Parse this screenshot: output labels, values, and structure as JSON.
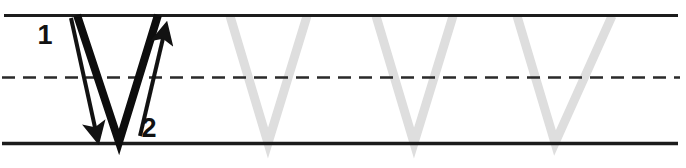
{
  "worksheet": {
    "title": "Letter V handwriting practice worksheet",
    "letter": "V",
    "case": "uppercase",
    "width": 686,
    "height": 168,
    "background_color": "#ffffff"
  },
  "guide_lines": {
    "top_line": {
      "label": "top-line",
      "style": "solid",
      "y": 15.5,
      "x_start": 4,
      "x_end": 678,
      "color": "#1c1c1c",
      "thickness": 3
    },
    "mid_line": {
      "label": "mid-dashed-line",
      "style": "dashed",
      "y": 77.5,
      "x_start": 2,
      "x_end": 680,
      "color": "#2a2a2a",
      "thickness": 2.4,
      "dash": 13,
      "gap": 8
    },
    "bottom_line": {
      "label": "baseline",
      "style": "solid",
      "y": 143.5,
      "x_start": 2,
      "x_end": 678,
      "color": "#1c1c1c",
      "thickness": 3.4
    }
  },
  "model_letter": {
    "name": "model-letter-v",
    "color": "#0d0d0d",
    "stroke_width": 8,
    "left_limb": {
      "x1": 77,
      "y1": 15,
      "x2": 119,
      "y2": 142
    },
    "right_limb": {
      "x1": 119,
      "y1": 142,
      "x2": 158,
      "y2": 15
    }
  },
  "stroke_guides": [
    {
      "name": "stroke-arrow-1",
      "order": 1,
      "direction": "down-right",
      "color": "#121212",
      "stroke_width": 4,
      "x1": 71,
      "y1": 18,
      "x2": 96,
      "y2": 132,
      "arrowhead_x": 98,
      "arrowhead_y": 139,
      "label": "1",
      "label_x": 45,
      "label_y": 44,
      "label_size": 27
    },
    {
      "name": "stroke-arrow-2",
      "order": 2,
      "direction": "up-right",
      "color": "#121212",
      "stroke_width": 4,
      "x1": 140,
      "y1": 136,
      "x2": 164,
      "y2": 34,
      "arrowhead_x": 166,
      "arrowhead_y": 24,
      "label": "2",
      "label_x": 149,
      "label_y": 137,
      "label_size": 27
    }
  ],
  "tracing_letters": [
    {
      "name": "tracing-letter-v-1",
      "index": 1,
      "color": "#dedede",
      "stroke_width": 9,
      "apex_x": 268,
      "top_left_x": 230,
      "top_right_x": 307,
      "top_y": 16,
      "bottom_y": 143
    },
    {
      "name": "tracing-letter-v-2",
      "index": 2,
      "color": "#dedede",
      "stroke_width": 9,
      "apex_x": 414,
      "top_left_x": 376,
      "top_right_x": 453,
      "top_y": 16,
      "bottom_y": 143
    },
    {
      "name": "tracing-letter-v-3",
      "index": 3,
      "color": "#dedede",
      "stroke_width": 9,
      "apex_x": 555,
      "top_left_x": 517,
      "top_right_x": 612,
      "top_y": 16,
      "bottom_y": 143
    }
  ]
}
